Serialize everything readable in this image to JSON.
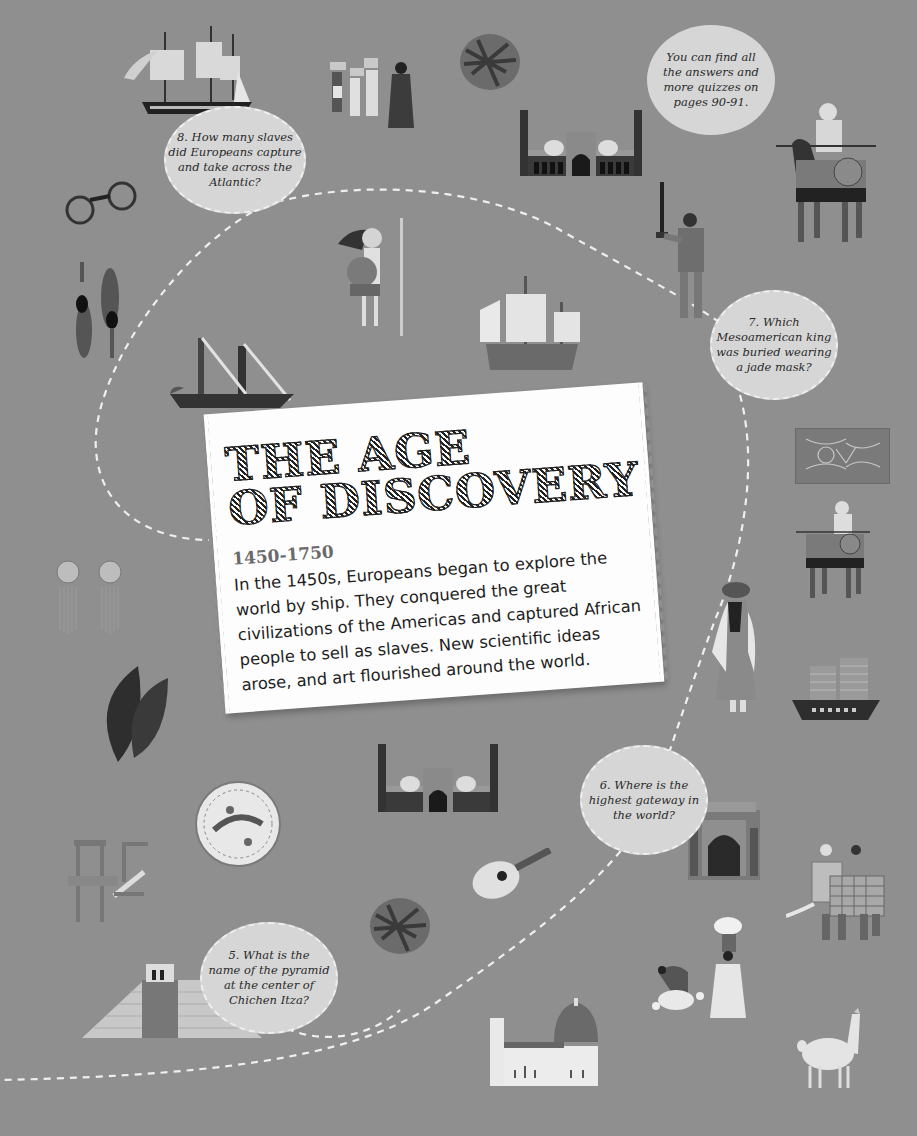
{
  "page": {
    "background_color": "#8f8f8f",
    "card_color": "#fdfdfd",
    "bubble_color": "#d6d6d6",
    "path_color": "#efefef"
  },
  "title_card": {
    "title_line1": "THE AGE",
    "title_line2": "OF DISCOVERY",
    "dates": "1450-1750",
    "body": "In the 1450s, Europeans began to explore the world by ship. They conquered the great civilizations of the Americas and captured African people to sell as slaves. New scientific ideas arose, and art flourished around the world."
  },
  "info_bubble": {
    "text": "You can find all\nthe answers and\nmore quizzes on\npages 90-91."
  },
  "questions": [
    {
      "number": "8",
      "text": "8. How many slaves\ndid Europeans capture\nand take across the\nAtlantic?"
    },
    {
      "number": "7",
      "text": "7. Which\nMesoamerican king\nwas buried wearing\na jade mask?"
    },
    {
      "number": "6",
      "text": "6. Where is the\nhighest gateway in\nthe world?"
    },
    {
      "number": "5",
      "text": "5. What is the\nname of the pyramid\nat the center of\nChichen Itza?"
    }
  ],
  "illustrations": [
    {
      "name": "tall-ship",
      "label": "Tall sailing ship"
    },
    {
      "name": "slave-porters",
      "label": "People carrying baskets with merchant"
    },
    {
      "name": "spice-bundle",
      "label": "Spice bundle"
    },
    {
      "name": "jama-masjid",
      "label": "Mosque with minarets"
    },
    {
      "name": "mounted-knight",
      "label": "Armored horseman"
    },
    {
      "name": "shackles",
      "label": "Iron shackles"
    },
    {
      "name": "feather-ornaments",
      "label": "Feather ornaments"
    },
    {
      "name": "aztec-warrior",
      "label": "Aztec warrior with spear"
    },
    {
      "name": "torch-bearer",
      "label": "Mesoamerican figure with torch"
    },
    {
      "name": "caravel",
      "label": "Caravel ship"
    },
    {
      "name": "galley",
      "label": "Galley ship"
    },
    {
      "name": "nazca-textile",
      "label": "Patterned textile"
    },
    {
      "name": "mounted-warrior",
      "label": "Mounted warrior"
    },
    {
      "name": "earrings",
      "label": "Tasseled earrings"
    },
    {
      "name": "veiled-figure",
      "label": "Veiled figure"
    },
    {
      "name": "junk-ship",
      "label": "Chinese junk ship"
    },
    {
      "name": "tobacco-leaves",
      "label": "Tobacco leaves"
    },
    {
      "name": "mosque-2",
      "label": "Mosque with minarets"
    },
    {
      "name": "decorated-plate",
      "label": "Decorated plate"
    },
    {
      "name": "printing-press",
      "label": "Printing press"
    },
    {
      "name": "lute",
      "label": "Lute"
    },
    {
      "name": "buland-darwaza",
      "label": "Gateway"
    },
    {
      "name": "war-elephant",
      "label": "Decorated elephant with riders"
    },
    {
      "name": "spice-bundle-2",
      "label": "Spice bundle"
    },
    {
      "name": "el-castillo",
      "label": "Stepped pyramid"
    },
    {
      "name": "cotton-pickers",
      "label": "Cotton pickers"
    },
    {
      "name": "florence-cathedral",
      "label": "Domed cathedral"
    },
    {
      "name": "llama",
      "label": "Llama"
    }
  ]
}
